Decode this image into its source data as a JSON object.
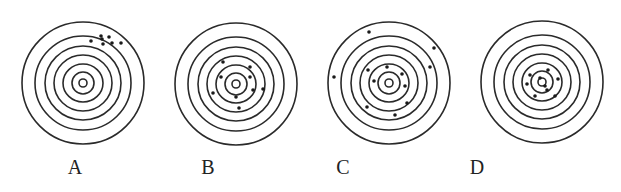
{
  "figure": {
    "type": "shooting-targets",
    "ring_color": "#2a2a2a",
    "dot_color": "#1a1a1a",
    "ring_radii": [
      [
        61,
        61
      ],
      [
        48,
        47
      ],
      [
        38,
        37
      ],
      [
        29,
        28
      ],
      [
        20,
        19
      ],
      [
        11,
        11
      ],
      [
        4,
        4
      ]
    ],
    "targets": [
      {
        "label": "A",
        "center": [
          83,
          83
        ],
        "label_x": 75,
        "dots": [
          [
            91,
            41
          ],
          [
            101,
            36
          ],
          [
            102,
            39
          ],
          [
            109,
            37
          ],
          [
            103,
            44
          ],
          [
            112,
            43
          ],
          [
            121,
            43
          ]
        ]
      },
      {
        "label": "B",
        "center": [
          236,
          84
        ],
        "label_x": 208,
        "dots": [
          [
            223,
            62
          ],
          [
            250,
            67
          ],
          [
            221,
            77
          ],
          [
            250,
            77
          ],
          [
            213,
            93
          ],
          [
            236,
            97
          ],
          [
            253,
            90
          ],
          [
            263,
            89
          ],
          [
            239,
            108
          ]
        ]
      },
      {
        "label": "C",
        "center": [
          389,
          83
        ],
        "label_x": 343,
        "dots": [
          [
            369,
            32
          ],
          [
            434,
            48
          ],
          [
            334,
            77
          ],
          [
            430,
            67
          ],
          [
            368,
            70
          ],
          [
            387,
            67
          ],
          [
            402,
            74
          ],
          [
            374,
            81
          ],
          [
            405,
            86
          ],
          [
            407,
            103
          ],
          [
            367,
            107
          ],
          [
            395,
            115
          ]
        ]
      },
      {
        "label": "D",
        "center": [
          542,
          82
        ],
        "label_x": 477,
        "dots": [
          [
            530,
            75
          ],
          [
            548,
            70
          ],
          [
            558,
            79
          ],
          [
            527,
            84
          ],
          [
            535,
            96
          ],
          [
            555,
            96
          ],
          [
            547,
            90
          ],
          [
            540,
            78
          ],
          [
            545,
            86
          ]
        ]
      }
    ]
  }
}
